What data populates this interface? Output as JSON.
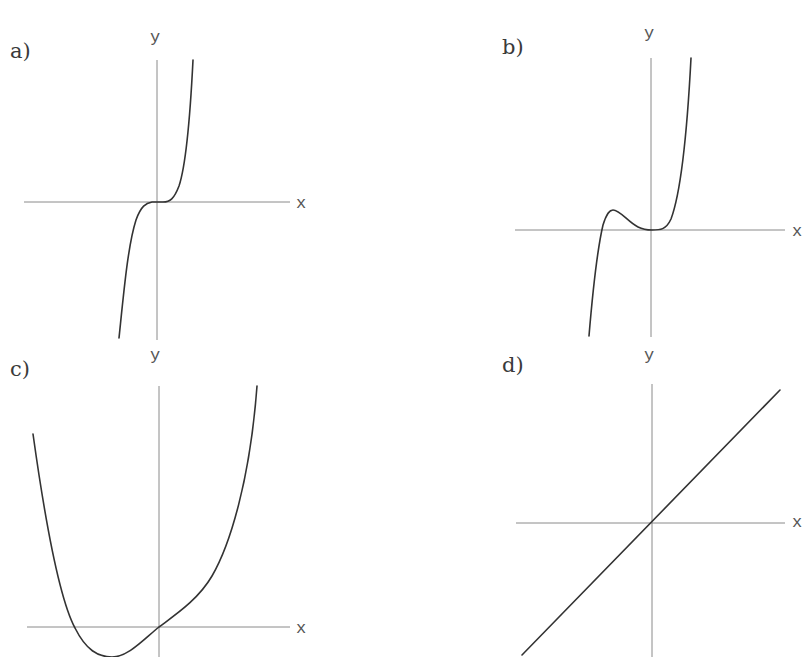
{
  "figure": {
    "colors": {
      "background": "#ffffff",
      "axis": "#8a8a8a",
      "curve": "#333333",
      "text": "#3a3a3a"
    }
  },
  "panels": [
    {
      "id": "a",
      "label": "a)",
      "x_axis_label": "x",
      "y_axis_label": "y",
      "shape": "cubic-like inflection at origin (y ~ x^5), flat near 0, steep rise/fall",
      "label_pos": [
        10,
        58
      ],
      "ylabel_pos": [
        150,
        42
      ],
      "xlabel_pos": [
        296,
        208
      ],
      "x_axis": [
        24,
        202,
        290,
        202
      ],
      "y_axis": [
        157,
        60,
        157,
        340
      ],
      "curve": "M119,338 C124,290 128,245 136,220 C141,206 146,203 152,202 L163,202 C170,202 174,199 179,186 C186,165 190,120 193,60"
    },
    {
      "id": "b",
      "label": "b)",
      "x_axis_label": "x",
      "y_axis_label": "y",
      "shape": "rises steeply from below, local max left of origin, local min (tangent) at origin, then rises steeply",
      "label_pos": [
        502,
        54
      ],
      "ylabel_pos": [
        644,
        38
      ],
      "xlabel_pos": [
        792,
        236
      ],
      "x_axis": [
        515,
        230,
        785,
        230
      ],
      "y_axis": [
        651,
        58,
        651,
        337
      ],
      "curve": "M589,336 C592,300 596,255 603,225 C607,212 610,210 613,210 C620,210 628,222 638,227 C644,230 648,230 652,230 C660,230 666,230 671,219 C680,195 687,135 691,58"
    },
    {
      "id": "c",
      "label": "c)",
      "x_axis_label": "x",
      "y_axis_label": "y",
      "shape": "quartic-like: high on left, dips below x-axis to a minimum left of origin, passes through origin, then rises steeply on right",
      "label_pos": [
        10,
        376
      ],
      "ylabel_pos": [
        150,
        360
      ],
      "xlabel_pos": [
        296,
        633
      ],
      "x_axis": [
        27,
        627,
        290,
        627
      ],
      "y_axis": [
        159,
        386,
        159,
        657
      ],
      "curve": "M33,434 C45,520 60,600 75,628 C86,650 98,657 112,657 C128,657 143,640 159,627 C175,615 198,600 212,576 C230,545 250,480 257,386"
    },
    {
      "id": "d",
      "label": "d)",
      "x_axis_label": "x",
      "y_axis_label": "y",
      "shape": "straight line with positive slope through origin",
      "label_pos": [
        502,
        372
      ],
      "ylabel_pos": [
        644,
        360
      ],
      "xlabel_pos": [
        792,
        527
      ],
      "x_axis": [
        516,
        523,
        785,
        523
      ],
      "y_axis": [
        652,
        384,
        652,
        657
      ],
      "curve": "M522,655 L780,390"
    }
  ],
  "chart_data": [
    {
      "type": "line",
      "title": "a)",
      "xlabel": "x",
      "ylabel": "y",
      "grid": false,
      "function_shape": "odd, flat inflection at origin (like x^5)",
      "x": [
        -1,
        -0.7,
        -0.4,
        0,
        0.4,
        0.7,
        1
      ],
      "values": [
        -1,
        -0.17,
        -0.01,
        0,
        0.01,
        0.17,
        1
      ]
    },
    {
      "type": "line",
      "title": "b)",
      "xlabel": "x",
      "ylabel": "y",
      "grid": false,
      "function_shape": "local max left of origin, double root at origin (like x^2(x+a) scaled)",
      "x": [
        -1,
        -0.75,
        -0.55,
        -0.3,
        0,
        0.3,
        0.7
      ],
      "values": [
        -1,
        0,
        0.08,
        0.02,
        0,
        0.06,
        1
      ]
    },
    {
      "type": "line",
      "title": "c)",
      "xlabel": "x",
      "ylabel": "y",
      "grid": false,
      "function_shape": "quartic-like, root left of origin, min below axis, passes through origin",
      "x": [
        -1,
        -0.65,
        -0.4,
        0,
        0.4,
        0.75
      ],
      "values": [
        0.8,
        0,
        -0.12,
        0,
        0.2,
        1
      ]
    },
    {
      "type": "line",
      "title": "d)",
      "xlabel": "x",
      "ylabel": "y",
      "grid": false,
      "function_shape": "linear y = x",
      "x": [
        -1,
        0,
        1
      ],
      "values": [
        -1,
        0,
        1
      ]
    }
  ]
}
